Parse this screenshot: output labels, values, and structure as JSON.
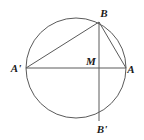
{
  "figure": {
    "background_color": "#ffffff",
    "stroke_color": "#5a5a5a",
    "label_color": "#1a1a1a",
    "canvas": {
      "width": 144,
      "height": 140
    },
    "circle": {
      "name": "circle",
      "cx": 76,
      "cy": 68,
      "r": 50,
      "stroke_width": 1
    },
    "points": [
      {
        "id": "A-prime",
        "label": "A'",
        "x": 26,
        "y": 68,
        "label_x": 16,
        "label_y": 72
      },
      {
        "id": "M",
        "label": "M",
        "x": 76,
        "y": 68,
        "label_x": 91,
        "label_y": 65
      },
      {
        "id": "A",
        "label": "A",
        "x": 126,
        "y": 68,
        "label_x": 131,
        "label_y": 73
      },
      {
        "id": "B",
        "label": "B",
        "x": 99,
        "y": 22,
        "label_x": 104,
        "label_y": 17
      },
      {
        "id": "B-prime",
        "label": "B'",
        "x": 99,
        "y": 121,
        "label_x": 102,
        "label_y": 133
      }
    ],
    "segments": [
      {
        "id": "diameter-a-prime-a",
        "from": "A'",
        "to": "A",
        "x1": 26,
        "y1": 68,
        "x2": 126,
        "y2": 68
      },
      {
        "id": "chord-b-b-prime",
        "from": "B",
        "to": "B'",
        "x1": 99,
        "y1": 22,
        "x2": 99,
        "y2": 121
      },
      {
        "id": "chord-a-prime-b",
        "from": "A'",
        "to": "B",
        "x1": 26,
        "y1": 68,
        "x2": 99,
        "y2": 22
      },
      {
        "id": "chord-b-a",
        "from": "B",
        "to": "A",
        "x1": 99,
        "y1": 22,
        "x2": 126,
        "y2": 68
      }
    ]
  }
}
